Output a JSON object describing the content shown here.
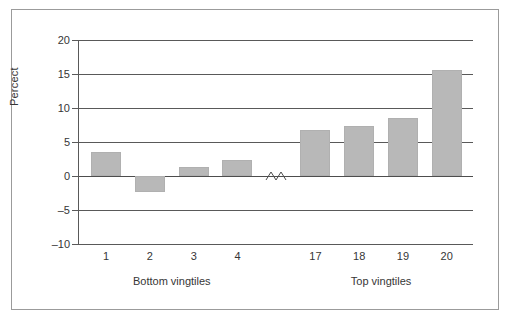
{
  "chart_data": {
    "type": "bar",
    "title": "",
    "subtitle": "",
    "xlabel": "",
    "ylabel": "Percect",
    "categories": [
      "1",
      "2",
      "3",
      "4",
      "17",
      "18",
      "19",
      "20"
    ],
    "values": [
      3.5,
      -2.3,
      1.3,
      2.3,
      6.7,
      7.4,
      8.6,
      15.6
    ],
    "series": [
      {
        "name": "",
        "values": [
          3.5,
          -2.3,
          1.3,
          2.3,
          6.7,
          7.4,
          8.6,
          15.6
        ]
      }
    ],
    "ylim": [
      -10,
      20
    ],
    "yticks": [
      20,
      15,
      10,
      5,
      0,
      -5,
      -10
    ],
    "ytick_labels": [
      "20",
      "15",
      "10",
      "5",
      "0",
      "-5",
      "-10"
    ],
    "grid": true,
    "legend": false,
    "legend_position": "none",
    "axis_break": true,
    "axis_break_note": "zig-zag break between vingtile 4 and vingtile 17 on the category axis",
    "group_labels": [
      {
        "label": "Bottom vingtiles",
        "categories": [
          "1",
          "2",
          "3",
          "4"
        ]
      },
      {
        "label": "Top vingtiles",
        "categories": [
          "17",
          "18",
          "19",
          "20"
        ]
      }
    ],
    "colors": {
      "bar_fill": "#b8b8b8",
      "bar_stroke": "#b0b0b0",
      "gridline": "#595959",
      "axis": "#595959",
      "text": "#363636",
      "frame_border": "#9b9b9b",
      "background": "#ffffff"
    }
  },
  "figure": {
    "frame_label": "chart-frame"
  }
}
